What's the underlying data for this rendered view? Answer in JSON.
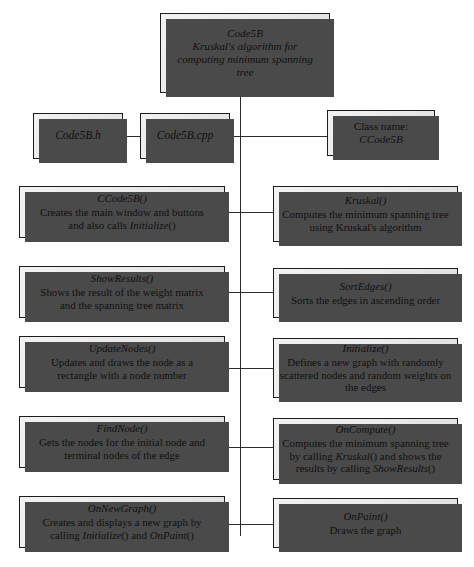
{
  "diagram": {
    "type": "hierarchy-flowchart",
    "root": {
      "title": "Code5B",
      "line2": "Kruskal's algorithm for",
      "line3": "computing minimum spanning",
      "line4": "tree"
    },
    "files": [
      {
        "label": "Code5B.h"
      },
      {
        "label": "Code5B.cpp"
      }
    ],
    "class_box": {
      "caption": "Class name:",
      "name": "CCode5B"
    },
    "left_column": [
      {
        "name": "CCode5B()",
        "desc_line1": "Creates the main window and buttons",
        "desc_line2": "and also calls ",
        "desc_italic": "Initialize",
        "desc_line3": "()"
      },
      {
        "name": "ShowResults()",
        "desc_line1": "Shows the result of the weight matrix",
        "desc_line2": "and the spanning tree matrix",
        "desc_italic": "",
        "desc_line3": ""
      },
      {
        "name": "UpdateNodes()",
        "desc_line1": "Updates and draws the node as a",
        "desc_line2": "rectangle with a node number",
        "desc_italic": "",
        "desc_line3": ""
      },
      {
        "name": "FindNode()",
        "desc_line1": "Gets the nodes for the initial node and",
        "desc_line2": "terminal nodes of the edge",
        "desc_italic": "",
        "desc_line3": ""
      },
      {
        "name": "OnNewGraph()",
        "desc_line1": "Creates and displays a new graph by",
        "desc_line2": "calling ",
        "desc_italic": "Initialize",
        "desc_line3": "() and ",
        "desc_italic2": "OnPaint",
        "desc_line4": "()"
      }
    ],
    "right_column": [
      {
        "name": "Kruskal()",
        "desc_line1": "Computes the minimum spanning tree",
        "desc_line2": "using Kruskal's algorithm",
        "desc_line3": ""
      },
      {
        "name": "SortEdges()",
        "desc_line1": "Sorts the edges in ascending order",
        "desc_line2": "",
        "desc_line3": ""
      },
      {
        "name": "Initialize()",
        "desc_line1": "Defines a new graph with randomly",
        "desc_line2": "scattered nodes and random weights on",
        "desc_line3": "the edges"
      },
      {
        "name": "OnCompute()",
        "desc_line1": "Computes the minimum spanning tree",
        "desc_line2": "by calling ",
        "desc_italic": "Kruskal",
        "desc_line3": "() and shows the",
        "desc_line4": "results by calling ",
        "desc_italic2": "ShowResults",
        "desc_line5": "()"
      },
      {
        "name": "OnPaint()",
        "desc_line1": "Draws the graph",
        "desc_line2": "",
        "desc_line3": ""
      }
    ],
    "colors": {
      "box_fill": "#eeeeec",
      "box_border": "#1d1d1d",
      "shadow": "#4a4a4a",
      "line": "#2b2b2b",
      "text": "#111111",
      "background": "#ffffff"
    }
  }
}
